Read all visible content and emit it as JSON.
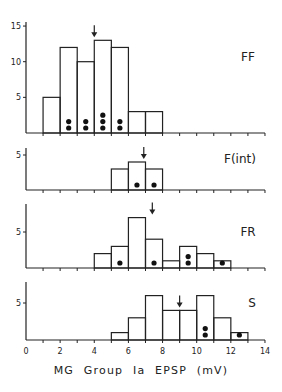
{
  "chart_data": [
    {
      "type": "bar",
      "panel": "FF",
      "label": "FF",
      "bin_width": 1,
      "bins": [
        {
          "x0": 1,
          "x1": 2,
          "count": 5,
          "dots": 0
        },
        {
          "x0": 2,
          "x1": 3,
          "count": 12,
          "dots": 2
        },
        {
          "x0": 3,
          "x1": 4,
          "count": 10,
          "dots": 2
        },
        {
          "x0": 4,
          "x1": 5,
          "count": 13,
          "dots": 3
        },
        {
          "x0": 5,
          "x1": 6,
          "count": 12,
          "dots": 2
        },
        {
          "x0": 6,
          "x1": 7,
          "count": 3,
          "dots": 0
        },
        {
          "x0": 7,
          "x1": 8,
          "count": 3,
          "dots": 0
        }
      ],
      "arrow_x": 4.0,
      "yticks": [
        5,
        10,
        15
      ],
      "ylim": [
        0,
        15
      ]
    },
    {
      "type": "bar",
      "panel": "F(int)",
      "label": "F(int)",
      "bin_width": 1,
      "bins": [
        {
          "x0": 5,
          "x1": 6,
          "count": 3,
          "dots": 0
        },
        {
          "x0": 6,
          "x1": 7,
          "count": 4,
          "dots": 1
        },
        {
          "x0": 7,
          "x1": 8,
          "count": 3,
          "dots": 1
        }
      ],
      "arrow_x": 6.9,
      "yticks": [
        5
      ],
      "ylim": [
        0,
        6
      ]
    },
    {
      "type": "bar",
      "panel": "FR",
      "label": "FR",
      "bin_width": 1,
      "bins": [
        {
          "x0": 4,
          "x1": 5,
          "count": 2,
          "dots": 0
        },
        {
          "x0": 5,
          "x1": 6,
          "count": 3,
          "dots": 1
        },
        {
          "x0": 6,
          "x1": 7,
          "count": 7,
          "dots": 0
        },
        {
          "x0": 7,
          "x1": 8,
          "count": 4,
          "dots": 1
        },
        {
          "x0": 8,
          "x1": 9,
          "count": 1,
          "dots": 0
        },
        {
          "x0": 9,
          "x1": 10,
          "count": 3,
          "dots": 2
        },
        {
          "x0": 10,
          "x1": 11,
          "count": 2,
          "dots": 0
        },
        {
          "x0": 11,
          "x1": 12,
          "count": 1,
          "dots": 1
        }
      ],
      "arrow_x": 7.4,
      "yticks": [
        5
      ],
      "ylim": [
        0,
        9
      ]
    },
    {
      "type": "bar",
      "panel": "S",
      "label": "S",
      "bin_width": 1,
      "bins": [
        {
          "x0": 5,
          "x1": 6,
          "count": 1,
          "dots": 0
        },
        {
          "x0": 6,
          "x1": 7,
          "count": 3,
          "dots": 0
        },
        {
          "x0": 7,
          "x1": 8,
          "count": 6,
          "dots": 0
        },
        {
          "x0": 8,
          "x1": 9,
          "count": 4,
          "dots": 0
        },
        {
          "x0": 9,
          "x1": 10,
          "count": 4,
          "dots": 0
        },
        {
          "x0": 10,
          "x1": 11,
          "count": 6,
          "dots": 2
        },
        {
          "x0": 11,
          "x1": 12,
          "count": 3,
          "dots": 0
        },
        {
          "x0": 12,
          "x1": 13,
          "count": 1,
          "dots": 1
        }
      ],
      "arrow_x": 9.0,
      "yticks": [
        5
      ],
      "ylim": [
        0,
        8
      ]
    }
  ],
  "figure": {
    "xlabel": "MG  Group  Ia  EPSP  (mV)",
    "xticks": [
      "0",
      "2",
      "4",
      "6",
      "8",
      "10",
      "12",
      "14"
    ],
    "xlim": [
      0,
      14
    ]
  },
  "layout": {
    "x0_px": 26,
    "px_per_unit_x": 17.07,
    "panels": [
      {
        "baseline": 133,
        "top": 22,
        "px_per_unit_y": 7.13,
        "label_x": 248,
        "label_y": 61
      },
      {
        "baseline": 190,
        "top": 148,
        "px_per_unit_y": 7.0,
        "label_x": 240,
        "label_y": 163
      },
      {
        "baseline": 268,
        "top": 204,
        "px_per_unit_y": 7.2,
        "label_x": 248,
        "label_y": 236
      },
      {
        "baseline": 340,
        "top": 282,
        "px_per_unit_y": 7.4,
        "label_x": 252,
        "label_y": 307
      }
    ]
  }
}
